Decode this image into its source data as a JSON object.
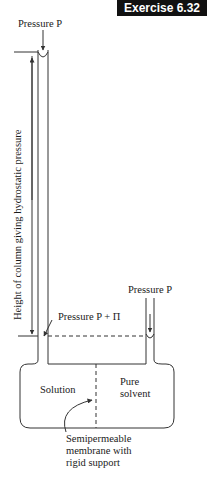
{
  "header": {
    "badge": "Exercise 6.32"
  },
  "diagram": {
    "labels": {
      "pressure_top": "Pressure P",
      "column_height": "Height of column giving hydrostatic pressure",
      "pressure_right": "Pressure P",
      "pressure_mid": "Pressure P + Π",
      "solution": "Solution",
      "pure_solvent_line1": "Pure",
      "pure_solvent_line2": "solvent",
      "membrane_line1": "Semipermeable",
      "membrane_line2": "membrane with",
      "membrane_line3": "rigid support"
    },
    "colors": {
      "line": "#333333",
      "badge_bg": "#111111",
      "badge_text": "#ffffff"
    }
  },
  "caption": {
    "text": "Figure 6.10 An Osmotic pressure apparatus"
  }
}
